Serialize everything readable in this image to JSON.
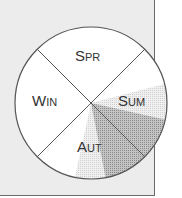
{
  "diagram": {
    "type": "season-wheel",
    "segments": [
      {
        "id": "spr",
        "label_big": "S",
        "label_small": "PR"
      },
      {
        "id": "sum",
        "label_big": "S",
        "label_small": "UM"
      },
      {
        "id": "aut",
        "label_big": "A",
        "label_small": "UT"
      },
      {
        "id": "win",
        "label_big": "W",
        "label_small": "IN"
      }
    ],
    "shaded_wedge": {
      "color_light": "#d8d8d8",
      "color_dark": "#a8a8a8"
    },
    "colors": {
      "panel": "#ececec",
      "circle_fill": "#ffffff",
      "stroke": "#555555"
    }
  }
}
